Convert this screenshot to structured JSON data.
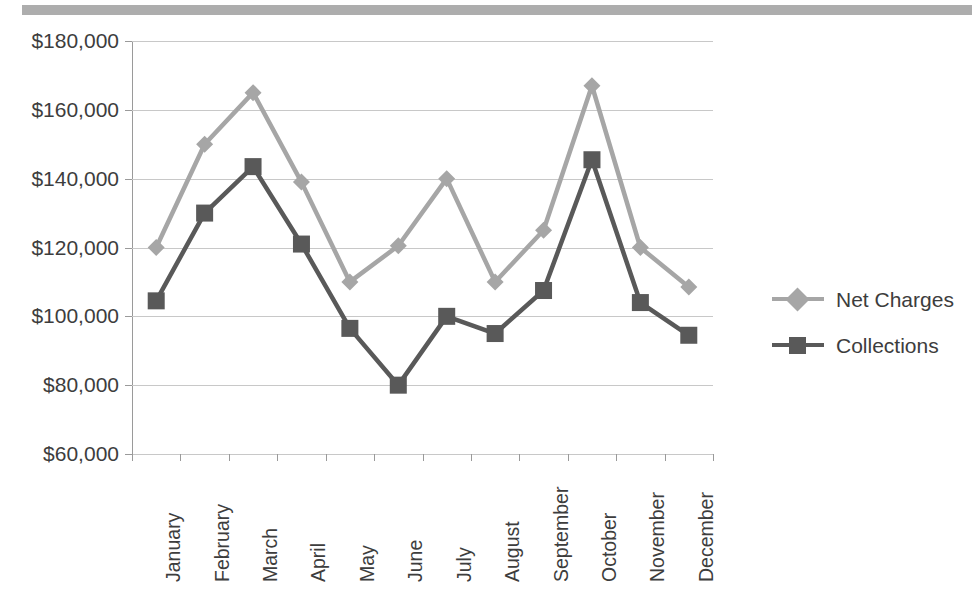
{
  "decor": {
    "top_bar_color": "#adadad"
  },
  "chart_data": {
    "type": "line",
    "title": "",
    "xlabel": "",
    "ylabel": "",
    "ylim": [
      60000,
      180000
    ],
    "ytick_step": 20000,
    "grid": true,
    "legend_position": "right",
    "categories": [
      "January",
      "February",
      "March",
      "April",
      "May",
      "June",
      "July",
      "August",
      "September",
      "October",
      "November",
      "December"
    ],
    "ytick_labels": [
      "$180,000",
      "$160,000",
      "$140,000",
      "$120,000",
      "$100,000",
      "$80,000",
      "$60,000"
    ],
    "ytick_values": [
      180000,
      160000,
      140000,
      120000,
      100000,
      80000,
      60000
    ],
    "series": [
      {
        "name": "Net Charges",
        "color": "#a6a6a6",
        "marker": "diamond",
        "values": [
          120000,
          150000,
          165000,
          139000,
          110000,
          120500,
          140000,
          110000,
          125000,
          167000,
          120000,
          108500
        ]
      },
      {
        "name": "Collections",
        "color": "#595959",
        "marker": "square",
        "values": [
          104500,
          130000,
          143500,
          121000,
          96500,
          80000,
          100000,
          95000,
          107500,
          145500,
          104000,
          94500
        ]
      }
    ]
  }
}
